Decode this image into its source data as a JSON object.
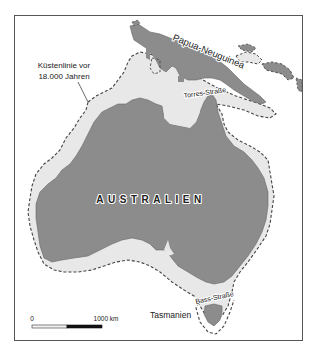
{
  "map": {
    "title": "Australien und Papua-Neuguinea – Küstenlinie vor 18.000 Jahren",
    "colors": {
      "land": "#8c8c8c",
      "shelf": "#e8e8e8",
      "sea": "#ffffff",
      "frame": "#555555",
      "coastline_dash": "#444444",
      "scale_dark": "#111111",
      "scale_light": "#f2f2f2"
    },
    "labels": {
      "papua": "Papua-Neuguinea",
      "torres": "Torres-Straße",
      "australia": "AUSTRALIEN",
      "bass": "Bass-Straße",
      "tasmania": "Tasmanien",
      "coastline_line1": "Küstenlinie vor",
      "coastline_line2": "18.000 Jahren"
    },
    "scale_bar": {
      "start_label": "0",
      "end_label": "1000 km"
    },
    "legend": {
      "dashed_line": "Küstenlinie vor 18.000 Jahren",
      "dark_fill": "heutige Landfläche",
      "light_fill": "trockengefallener Schelf"
    }
  }
}
